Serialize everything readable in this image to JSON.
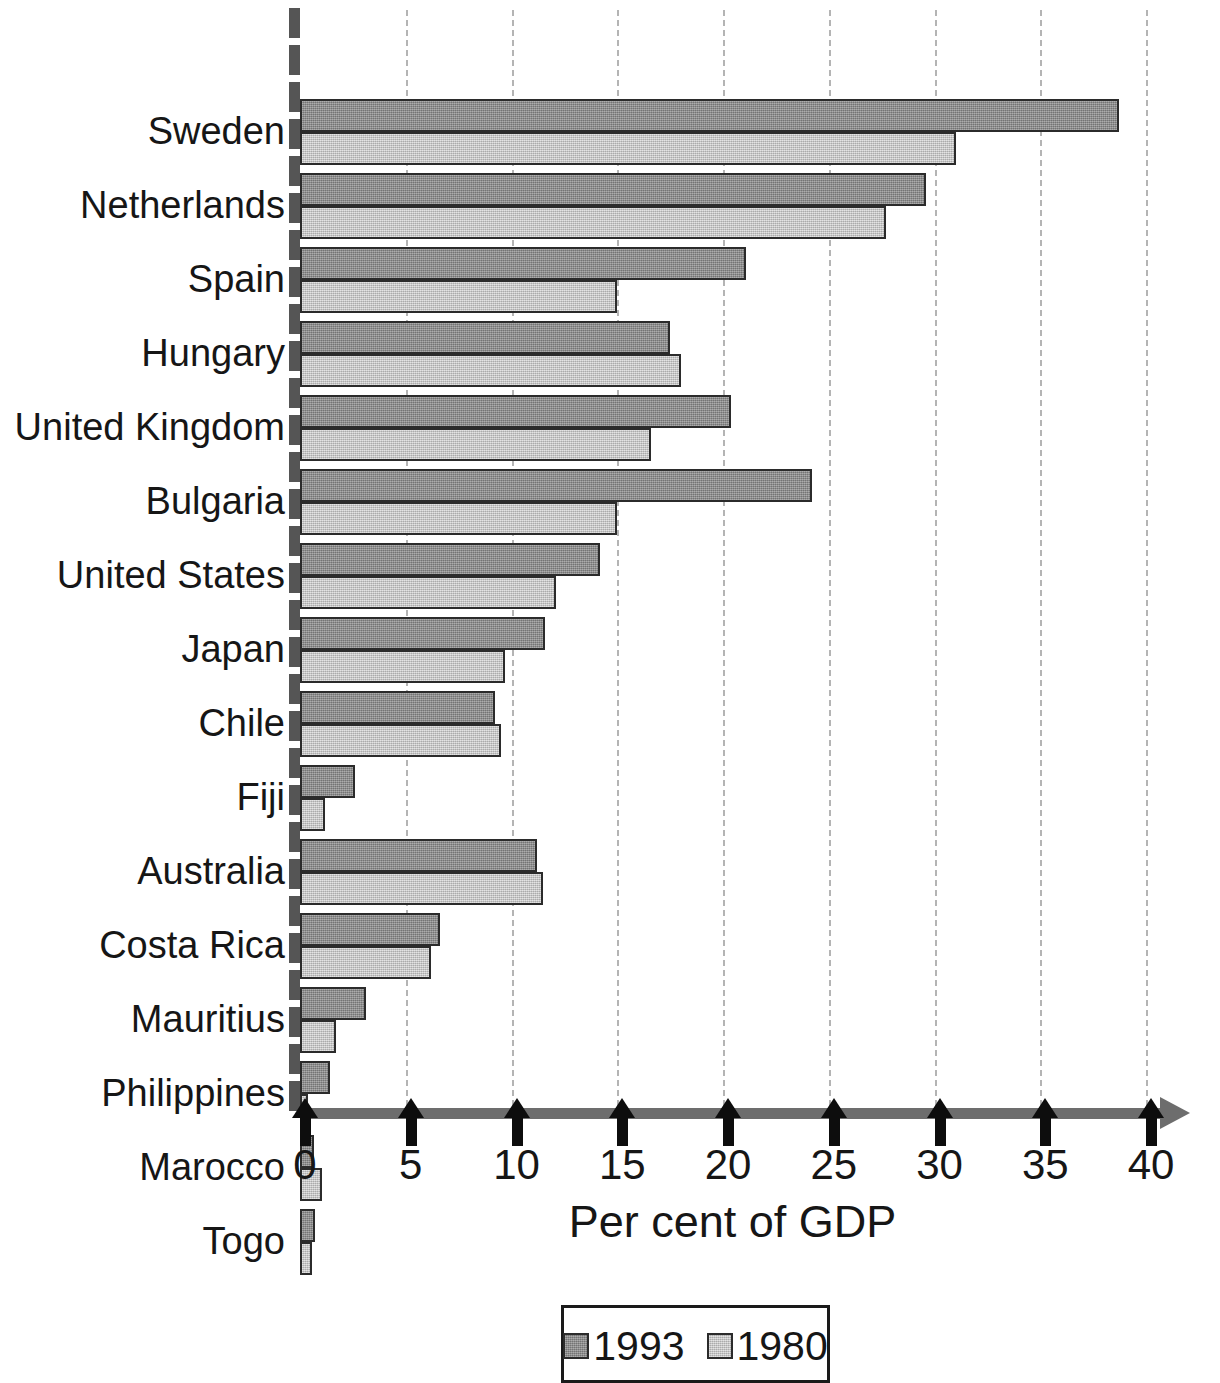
{
  "chart_data": {
    "type": "bar",
    "orientation": "horizontal",
    "title": "",
    "xlabel": "Per cent of GDP",
    "ylabel": "",
    "xlim": [
      0,
      40
    ],
    "xticks": [
      0,
      5,
      10,
      15,
      20,
      25,
      30,
      35,
      40
    ],
    "xtick_labels": [
      "0",
      "5",
      "10",
      "15",
      "20",
      "25",
      "30",
      "35",
      "40"
    ],
    "grid": true,
    "legend_position": "bottom-center",
    "categories": [
      "Sweden",
      "Netherlands",
      "Spain",
      "Hungary",
      "United Kingdom",
      "Bulgaria",
      "United States",
      "Japan",
      "Chile",
      "Fiji",
      "Australia",
      "Costa Rica",
      "Mauritius",
      "Philippines",
      "Marocco",
      "Togo"
    ],
    "series": [
      {
        "name": "1993",
        "color": "#8c8c8c",
        "values": [
          38.7,
          29.6,
          21.1,
          17.5,
          20.4,
          24.2,
          14.2,
          11.6,
          9.2,
          2.6,
          11.2,
          6.6,
          3.1,
          1.4,
          0.65,
          0.7
        ]
      },
      {
        "name": "1980",
        "color": "#cacaca",
        "values": [
          31.0,
          27.7,
          15.0,
          18.0,
          16.6,
          15.0,
          12.1,
          9.7,
          9.5,
          1.2,
          11.5,
          6.2,
          1.7,
          0.4,
          1.05,
          0.55
        ]
      }
    ]
  },
  "axis": {
    "title": "Per cent of GDP"
  },
  "legend": {
    "entries": [
      {
        "label": "1993",
        "series_class": "s1993"
      },
      {
        "label": "1980",
        "series_class": "s1980"
      }
    ]
  }
}
